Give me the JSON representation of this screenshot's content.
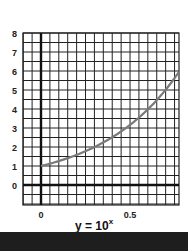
{
  "chart_data": {
    "type": "line",
    "equation": {
      "base": "y = 10",
      "exponent": "x"
    },
    "xlabel": "",
    "ylabel": "",
    "xlim": [
      -0.1,
      0.775
    ],
    "ylim": [
      -1,
      8
    ],
    "x_ticks": [
      {
        "value": 0,
        "label": "0"
      },
      {
        "value": 0.5,
        "label": "0.5"
      }
    ],
    "y_ticks": [
      {
        "value": 8,
        "label": "8"
      },
      {
        "value": 7,
        "label": "7"
      },
      {
        "value": 6,
        "label": "6"
      },
      {
        "value": 5,
        "label": "5"
      },
      {
        "value": 4,
        "label": "4"
      },
      {
        "value": 3,
        "label": "3"
      },
      {
        "value": 2,
        "label": "2"
      },
      {
        "value": 1,
        "label": "1"
      },
      {
        "value": 0,
        "label": "0"
      }
    ],
    "grid": true,
    "grid_spacing": {
      "x": 0.05,
      "y": 0.5
    },
    "series": [
      {
        "name": "y = 10^x",
        "x": [
          0,
          0.1,
          0.2,
          0.3,
          0.4,
          0.5,
          0.6,
          0.7,
          0.775
        ],
        "y": [
          1.0,
          1.26,
          1.58,
          2.0,
          2.51,
          3.16,
          3.98,
          5.01,
          5.96
        ],
        "color": "#7a7a7a"
      }
    ]
  },
  "colors": {
    "grid": "#222222",
    "axis": "#111111",
    "curve": "#7a7a7a",
    "background": "#ffffff",
    "bottom_bar": "#1e1e1e"
  }
}
